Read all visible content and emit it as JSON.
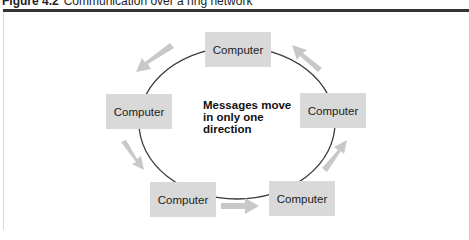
{
  "caption": {
    "figure_number": "Figure 4.2",
    "title": "Communication over a ring network"
  },
  "diagram": {
    "nodes": [
      {
        "id": "top",
        "label": "Computer"
      },
      {
        "id": "left",
        "label": "Computer"
      },
      {
        "id": "right",
        "label": "Computer"
      },
      {
        "id": "bottom-left",
        "label": "Computer"
      },
      {
        "id": "bottom-right",
        "label": "Computer"
      }
    ],
    "note": {
      "line1": "Messages move",
      "line2": "in only one",
      "line3": "direction"
    },
    "flow_direction": "counterclockwise",
    "colors": {
      "node_fill": "#d9d9d9",
      "ring_stroke": "#3a3a3a",
      "arrow_fill": "#c8c8c8",
      "rule": "#333333"
    }
  }
}
